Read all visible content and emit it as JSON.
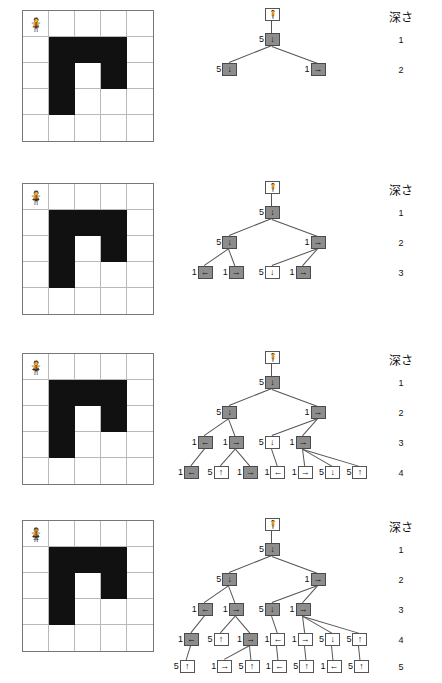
{
  "figure": {
    "depth_header": "深さ",
    "icons": {
      "star": "☆",
      "person": "🧍",
      "arrow_up": "↑",
      "arrow_down": "↓",
      "arrow_left": "←",
      "arrow_right": "→"
    },
    "colors": {
      "wall": "#111111",
      "grid_line": "#b9b9b9",
      "grid_border": "#777777",
      "node_visited_fill": "#8d8d8d",
      "node_frontier_fill": "#ffffff",
      "node_border": "#555555",
      "edge": "#555555",
      "text": "#1a1a1a"
    },
    "grid_size": {
      "cols": 5,
      "rows": 5
    },
    "maze_walls": [
      [
        1,
        1
      ],
      [
        2,
        1
      ],
      [
        3,
        1
      ],
      [
        1,
        2
      ],
      [
        3,
        2
      ],
      [
        1,
        3
      ]
    ],
    "start_cell": [
      0,
      0
    ],
    "person_cell": [
      2,
      2
    ]
  },
  "panels": [
    {
      "id": "panel-1",
      "depth_labels": [
        "1",
        "2"
      ],
      "grid_marks": [
        {
          "cell": [
            0,
            0
          ],
          "glyphs": [
            "☆"
          ]
        },
        {
          "cell": [
            2,
            2
          ],
          "glyphs": [
            "🧍"
          ]
        },
        {
          "cell": [
            2,
            3
          ],
          "glyphs": [
            "↓"
          ]
        },
        {
          "cell": [
            3,
            3
          ],
          "glyphs": [
            "→"
          ]
        },
        {
          "cell": [
            2,
            4
          ],
          "glyphs": [
            "↓"
          ]
        }
      ],
      "tree": {
        "rows": [
          {
            "depth": "0",
            "nodes": [
              {
                "label": "",
                "arrow": "🧍",
                "filled": false,
                "x": 100
              }
            ]
          },
          {
            "depth": "1",
            "nodes": [
              {
                "label": "5",
                "arrow": "↓",
                "filled": true,
                "x": 100
              }
            ]
          },
          {
            "depth": "2",
            "nodes": [
              {
                "label": "5",
                "arrow": "↓",
                "filled": true,
                "x": 55
              },
              {
                "label": "1",
                "arrow": "→",
                "filled": true,
                "x": 148
              }
            ]
          }
        ]
      }
    },
    {
      "id": "panel-2",
      "depth_labels": [
        "1",
        "2",
        "3"
      ],
      "grid_marks": [
        {
          "cell": [
            0,
            0
          ],
          "glyphs": [
            "☆"
          ]
        },
        {
          "cell": [
            2,
            2
          ],
          "glyphs": [
            "🧍"
          ]
        },
        {
          "cell": [
            2,
            3
          ],
          "glyphs": [
            "↓"
          ]
        },
        {
          "cell": [
            3,
            3
          ],
          "glyphs": [
            "→"
          ]
        },
        {
          "cell": [
            4,
            3
          ],
          "glyphs": [
            "→"
          ]
        },
        {
          "cell": [
            1,
            4
          ],
          "glyphs": [
            "←"
          ]
        },
        {
          "cell": [
            2,
            4
          ],
          "glyphs": [
            "↓"
          ]
        },
        {
          "cell": [
            3,
            4
          ],
          "glyphs": [
            "→"
          ]
        }
      ],
      "tree": {
        "rows": [
          {
            "depth": "0",
            "nodes": [
              {
                "label": "",
                "arrow": "🧍",
                "filled": false,
                "x": 100
              }
            ]
          },
          {
            "depth": "1",
            "nodes": [
              {
                "label": "5",
                "arrow": "↓",
                "filled": true,
                "x": 100
              }
            ]
          },
          {
            "depth": "2",
            "nodes": [
              {
                "label": "5",
                "arrow": "↓",
                "filled": true,
                "x": 55
              },
              {
                "label": "1",
                "arrow": "→",
                "filled": true,
                "x": 148
              }
            ]
          },
          {
            "depth": "3",
            "nodes": [
              {
                "label": "1",
                "arrow": "←",
                "filled": true,
                "x": 33
              },
              {
                "label": "1",
                "arrow": "→",
                "filled": true,
                "x": 76
              },
              {
                "label": "5",
                "arrow": "↓",
                "filled": false,
                "x": 126
              },
              {
                "label": "1",
                "arrow": "→",
                "filled": true,
                "x": 169
              }
            ]
          }
        ]
      }
    },
    {
      "id": "panel-3",
      "depth_labels": [
        "1",
        "2",
        "3",
        "4"
      ],
      "grid_marks": [
        {
          "cell": [
            0,
            0
          ],
          "glyphs": [
            "☆"
          ]
        },
        {
          "cell": [
            2,
            2
          ],
          "glyphs": [
            "🧍"
          ]
        },
        {
          "cell": [
            2,
            3
          ],
          "glyphs": [
            "↓"
          ]
        },
        {
          "cell": [
            3,
            3
          ],
          "glyphs": [
            "→"
          ]
        },
        {
          "cell": [
            4,
            3
          ],
          "glyphs": [
            "→"
          ]
        },
        {
          "cell": [
            0,
            4
          ],
          "glyphs": [
            "←"
          ]
        },
        {
          "cell": [
            1,
            4
          ],
          "glyphs": [
            "←"
          ]
        },
        {
          "cell": [
            2,
            4
          ],
          "glyphs": [
            "↓"
          ]
        },
        {
          "cell": [
            3,
            4
          ],
          "glyphs": [
            "→"
          ]
        },
        {
          "cell": [
            4,
            4
          ],
          "glyphs": [
            "→"
          ]
        }
      ],
      "tree": {
        "rows": [
          {
            "depth": "0",
            "nodes": [
              {
                "label": "",
                "arrow": "🧍",
                "filled": false,
                "x": 100
              }
            ]
          },
          {
            "depth": "1",
            "nodes": [
              {
                "label": "5",
                "arrow": "↓",
                "filled": true,
                "x": 100
              }
            ]
          },
          {
            "depth": "2",
            "nodes": [
              {
                "label": "5",
                "arrow": "↓",
                "filled": true,
                "x": 55
              },
              {
                "label": "1",
                "arrow": "→",
                "filled": true,
                "x": 148
              }
            ]
          },
          {
            "depth": "3",
            "nodes": [
              {
                "label": "1",
                "arrow": "←",
                "filled": true,
                "x": 33
              },
              {
                "label": "1",
                "arrow": "→",
                "filled": true,
                "x": 76
              },
              {
                "label": "5",
                "arrow": "↓",
                "filled": false,
                "x": 126
              },
              {
                "label": "1",
                "arrow": "→",
                "filled": true,
                "x": 169
              }
            ]
          },
          {
            "depth": "4",
            "nodes": [
              {
                "label": "1",
                "arrow": "←",
                "filled": true,
                "x": 14
              },
              {
                "label": "5",
                "arrow": "↑",
                "filled": false,
                "x": 55
              },
              {
                "label": "1",
                "arrow": "→",
                "filled": true,
                "x": 96
              },
              {
                "label": "1",
                "arrow": "←",
                "filled": false,
                "x": 134
              },
              {
                "label": "1",
                "arrow": "→",
                "filled": false,
                "x": 172
              },
              {
                "label": "5",
                "arrow": "↓",
                "filled": false,
                "x": 210
              },
              {
                "label": "5",
                "arrow": "↑",
                "filled": false,
                "x": 248
              }
            ]
          }
        ]
      }
    },
    {
      "id": "panel-4",
      "depth_labels": [
        "1",
        "2",
        "3",
        "4",
        "5"
      ],
      "grid_marks": [
        {
          "cell": [
            0,
            0
          ],
          "glyphs": [
            "☆"
          ]
        },
        {
          "cell": [
            2,
            2
          ],
          "glyphs": [
            "🧍"
          ]
        },
        {
          "cell": [
            2,
            3
          ],
          "glyphs": [
            "↓"
          ]
        },
        {
          "cell": [
            3,
            3
          ],
          "glyphs": [
            "→"
          ]
        },
        {
          "cell": [
            4,
            3
          ],
          "glyphs": [
            "→"
          ]
        },
        {
          "cell": [
            0,
            4
          ],
          "glyphs": [
            "←"
          ]
        },
        {
          "cell": [
            1,
            4
          ],
          "glyphs": [
            "←"
          ]
        },
        {
          "cell": [
            2,
            4
          ],
          "glyphs": [
            "↓"
          ]
        },
        {
          "cell": [
            3,
            4
          ],
          "glyphs": [
            "↓",
            "→"
          ]
        },
        {
          "cell": [
            4,
            4
          ],
          "glyphs": [
            "→"
          ]
        }
      ],
      "tree": {
        "rows": [
          {
            "depth": "0",
            "nodes": [
              {
                "label": "",
                "arrow": "🧍",
                "filled": false,
                "x": 100
              }
            ]
          },
          {
            "depth": "1",
            "nodes": [
              {
                "label": "5",
                "arrow": "↓",
                "filled": true,
                "x": 100
              }
            ]
          },
          {
            "depth": "2",
            "nodes": [
              {
                "label": "5",
                "arrow": "↓",
                "filled": true,
                "x": 55
              },
              {
                "label": "1",
                "arrow": "→",
                "filled": true,
                "x": 148
              }
            ]
          },
          {
            "depth": "3",
            "nodes": [
              {
                "label": "1",
                "arrow": "←",
                "filled": true,
                "x": 33
              },
              {
                "label": "1",
                "arrow": "→",
                "filled": true,
                "x": 76
              },
              {
                "label": "5",
                "arrow": "↓",
                "filled": true,
                "x": 126
              },
              {
                "label": "1",
                "arrow": "→",
                "filled": true,
                "x": 169
              }
            ]
          },
          {
            "depth": "4",
            "nodes": [
              {
                "label": "1",
                "arrow": "←",
                "filled": true,
                "x": 14
              },
              {
                "label": "5",
                "arrow": "↑",
                "filled": false,
                "x": 55
              },
              {
                "label": "1",
                "arrow": "→",
                "filled": true,
                "x": 96
              },
              {
                "label": "1",
                "arrow": "←",
                "filled": false,
                "x": 134
              },
              {
                "label": "1",
                "arrow": "→",
                "filled": false,
                "x": 172
              },
              {
                "label": "5",
                "arrow": "↓",
                "filled": false,
                "x": 210
              },
              {
                "label": "5",
                "arrow": "↑",
                "filled": false,
                "x": 248
              }
            ]
          },
          {
            "depth": "5",
            "nodes": [
              {
                "label": "5",
                "arrow": "↑",
                "filled": false,
                "x": 8
              },
              {
                "label": "1",
                "arrow": "→",
                "filled": false,
                "x": 60
              },
              {
                "label": "5",
                "arrow": "↑",
                "filled": false,
                "x": 98
              },
              {
                "label": "1",
                "arrow": "←",
                "filled": false,
                "x": 136
              },
              {
                "label": "5",
                "arrow": "↑",
                "filled": false,
                "x": 174
              },
              {
                "label": "1",
                "arrow": "←",
                "filled": false,
                "x": 212
              },
              {
                "label": "5",
                "arrow": "↑",
                "filled": false,
                "x": 250
              }
            ]
          }
        ]
      }
    }
  ]
}
